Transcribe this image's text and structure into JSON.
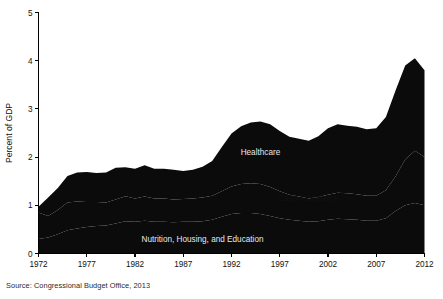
{
  "chart_data": {
    "type": "area",
    "title": "",
    "subtitle": "",
    "xlabel": "",
    "ylabel": "Percent of GDP",
    "stacked": true,
    "grid": false,
    "legend_position": "inline-annotations",
    "xlim": [
      1972,
      2012
    ],
    "ylim": [
      0,
      5
    ],
    "ytick_labels": [
      "0",
      "1",
      "2",
      "3",
      "4",
      "5"
    ],
    "ytick_values": [
      0,
      1,
      2,
      3,
      4,
      5
    ],
    "xtick_labels": [
      "1972",
      "1977",
      "1982",
      "1987",
      "1992",
      "1997",
      "2002",
      "2007",
      "2012"
    ],
    "xtick_values": [
      1972,
      1977,
      1982,
      1987,
      1992,
      1997,
      2002,
      2007,
      2012
    ],
    "x": [
      1972,
      1973,
      1974,
      1975,
      1976,
      1977,
      1978,
      1979,
      1980,
      1981,
      1982,
      1983,
      1984,
      1985,
      1986,
      1987,
      1988,
      1989,
      1990,
      1991,
      1992,
      1993,
      1994,
      1995,
      1996,
      1997,
      1998,
      1999,
      2000,
      2001,
      2002,
      2003,
      2004,
      2005,
      2006,
      2007,
      2008,
      2009,
      2010,
      2011,
      2012
    ],
    "series": [
      {
        "name": "Nutrition, Housing, and Education",
        "label_position_x": 1989,
        "label_position_y": 0.3,
        "label_color": "#e8e8e8",
        "values": [
          0.3,
          0.33,
          0.4,
          0.48,
          0.52,
          0.55,
          0.57,
          0.58,
          0.62,
          0.67,
          0.66,
          0.68,
          0.66,
          0.66,
          0.65,
          0.66,
          0.66,
          0.67,
          0.7,
          0.76,
          0.82,
          0.84,
          0.84,
          0.82,
          0.78,
          0.73,
          0.7,
          0.68,
          0.66,
          0.67,
          0.7,
          0.72,
          0.71,
          0.7,
          0.68,
          0.68,
          0.73,
          0.88,
          1.0,
          1.05,
          1.0
        ]
      },
      {
        "name": "Cash Assistance",
        "label_position_x": 2000,
        "label_position_y": 1.15,
        "label_color": "#111111",
        "values": [
          0.55,
          0.45,
          0.5,
          0.58,
          0.56,
          0.52,
          0.5,
          0.48,
          0.5,
          0.52,
          0.48,
          0.5,
          0.48,
          0.48,
          0.47,
          0.47,
          0.48,
          0.49,
          0.5,
          0.53,
          0.57,
          0.6,
          0.62,
          0.62,
          0.6,
          0.56,
          0.52,
          0.5,
          0.48,
          0.5,
          0.52,
          0.54,
          0.54,
          0.53,
          0.52,
          0.52,
          0.58,
          0.72,
          0.95,
          1.08,
          1.0
        ]
      },
      {
        "name": "Healthcare",
        "label_position_x": 1995,
        "label_position_y": 2.1,
        "label_color": "#e8e8e8",
        "values": [
          0.12,
          0.38,
          0.46,
          0.55,
          0.6,
          0.62,
          0.6,
          0.62,
          0.66,
          0.6,
          0.62,
          0.65,
          0.62,
          0.62,
          0.62,
          0.58,
          0.6,
          0.64,
          0.72,
          0.92,
          1.1,
          1.2,
          1.26,
          1.3,
          1.3,
          1.25,
          1.2,
          1.2,
          1.2,
          1.26,
          1.38,
          1.42,
          1.4,
          1.4,
          1.38,
          1.4,
          1.52,
          1.78,
          1.95,
          1.92,
          1.8
        ]
      }
    ],
    "totals": [
      0.97,
      1.16,
      1.36,
      1.61,
      1.68,
      1.69,
      1.67,
      1.68,
      1.78,
      1.79,
      1.76,
      1.83,
      1.76,
      1.76,
      1.74,
      1.71,
      1.74,
      1.8,
      1.92,
      2.21,
      2.49,
      2.64,
      2.72,
      2.74,
      2.68,
      2.54,
      2.42,
      2.38,
      2.34,
      2.43,
      2.6,
      2.68,
      2.65,
      2.63,
      2.58,
      2.6,
      2.83,
      3.38,
      3.9,
      4.05,
      3.8
    ],
    "annotations": [
      {
        "text": "Healthcare",
        "x": 1995,
        "y": 2.1
      },
      {
        "text": "Cash Assistance",
        "x": 2000,
        "y": 1.15
      },
      {
        "text": "Nutrition, Housing, and Education",
        "x": 1989,
        "y": 0.3
      }
    ],
    "colors": {
      "band_fill": "#0b0b0b",
      "background": "#ffffff",
      "axis": "#000000",
      "dark_label_text": "#e8e8e8",
      "light_label_text": "#111111"
    }
  },
  "source": {
    "note": "Source: Congressional Budget Office, 2013"
  }
}
